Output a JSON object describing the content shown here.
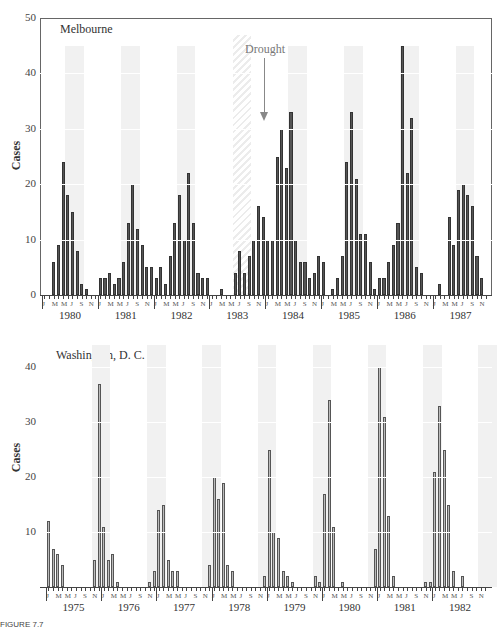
{
  "figure": {
    "caption_fragment": "FIGURE 7.7"
  },
  "chart_data": [
    {
      "type": "bar",
      "title": "Melbourne",
      "ylabel": "Cases",
      "xlabel": "",
      "ylim": [
        0,
        50
      ],
      "yticks": [
        0,
        10,
        20,
        30,
        40,
        50
      ],
      "month_tick_labels": [
        "J",
        "M",
        "M",
        "J",
        "S",
        "N"
      ],
      "years": [
        "1980",
        "1981",
        "1982",
        "1983",
        "1984",
        "1985",
        "1986",
        "1987"
      ],
      "annotation": {
        "text": "Drought",
        "year": "1983"
      },
      "series": [
        {
          "name": "1980",
          "values": [
            0,
            0,
            6,
            9,
            24,
            18,
            15,
            8,
            2,
            1,
            0,
            0
          ]
        },
        {
          "name": "1981",
          "values": [
            3,
            3,
            4,
            2,
            3,
            6,
            13,
            20,
            12,
            9,
            5,
            5
          ]
        },
        {
          "name": "1982",
          "values": [
            3,
            5,
            2,
            7,
            13,
            18,
            10,
            22,
            13,
            4,
            3,
            3
          ]
        },
        {
          "name": "1983",
          "values": [
            0,
            0,
            1,
            0,
            0,
            4,
            8,
            4,
            7,
            10,
            16,
            14
          ]
        },
        {
          "name": "1984",
          "values": [
            10,
            10,
            25,
            30,
            23,
            33,
            10,
            6,
            6,
            3,
            4,
            7
          ]
        },
        {
          "name": "1985",
          "values": [
            6,
            0,
            1,
            3,
            7,
            24,
            33,
            21,
            11,
            11,
            6,
            1
          ]
        },
        {
          "name": "1986",
          "values": [
            3,
            3,
            6,
            9,
            13,
            45,
            22,
            32,
            5,
            4,
            0,
            0
          ]
        },
        {
          "name": "1987",
          "values": [
            0,
            2,
            0,
            14,
            9,
            19,
            20,
            18,
            16,
            7,
            3,
            0
          ]
        }
      ]
    },
    {
      "type": "bar",
      "title": "Washington, D. C.",
      "ylabel": "Cases",
      "xlabel": "",
      "ylim": [
        0,
        45
      ],
      "yticks": [
        10,
        20,
        30,
        40
      ],
      "month_tick_labels": [
        "J",
        "M",
        "M",
        "J",
        "S",
        "N"
      ],
      "years": [
        "1975",
        "1976",
        "1977",
        "1978",
        "1979",
        "1980",
        "1981",
        "1982"
      ],
      "series": [
        {
          "name": "1975",
          "values": [
            12,
            7,
            6,
            4,
            0,
            0,
            0,
            0,
            0,
            0,
            5,
            37
          ]
        },
        {
          "name": "1976",
          "values": [
            11,
            5,
            6,
            1,
            0,
            0,
            0,
            0,
            0,
            0,
            1,
            3
          ]
        },
        {
          "name": "1977",
          "values": [
            14,
            15,
            5,
            3,
            3,
            0,
            0,
            0,
            0,
            0,
            0,
            4
          ]
        },
        {
          "name": "1978",
          "values": [
            20,
            16,
            19,
            4,
            3,
            0,
            0,
            0,
            0,
            0,
            0,
            2
          ]
        },
        {
          "name": "1979",
          "values": [
            25,
            10,
            9,
            3,
            2,
            1,
            0,
            0,
            0,
            0,
            2,
            1
          ]
        },
        {
          "name": "1980",
          "values": [
            17,
            34,
            11,
            0,
            1,
            0,
            0,
            0,
            0,
            0,
            0,
            7
          ]
        },
        {
          "name": "1981",
          "values": [
            40,
            31,
            13,
            2,
            0,
            0,
            0,
            0,
            0,
            0,
            1,
            1
          ]
        },
        {
          "name": "1982",
          "values": [
            21,
            33,
            25,
            15,
            3,
            0,
            2,
            0,
            0,
            0,
            0,
            0
          ]
        }
      ]
    }
  ]
}
